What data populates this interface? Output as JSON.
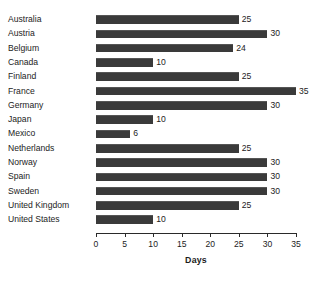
{
  "chart_data": {
    "type": "bar",
    "orientation": "horizontal",
    "title": "",
    "xlabel": "Days",
    "ylabel": "",
    "xlim": [
      0,
      35
    ],
    "xticks": [
      0,
      5,
      10,
      15,
      20,
      25,
      30,
      35
    ],
    "grid": false,
    "legend": null,
    "bar_color": "#3a3a3a",
    "value_labels": true,
    "categories": [
      "Australia",
      "Austria",
      "Belgium",
      "Canada",
      "Finland",
      "France",
      "Germany",
      "Japan",
      "Mexico",
      "Netherlands",
      "Norway",
      "Spain",
      "Sweden",
      "United Kingdom",
      "United States"
    ],
    "values": [
      25,
      30,
      24,
      10,
      25,
      35,
      30,
      10,
      6,
      25,
      30,
      30,
      30,
      25,
      10
    ]
  }
}
